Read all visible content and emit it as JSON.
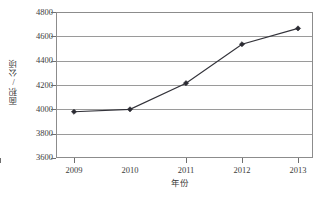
{
  "chart_data": {
    "type": "line",
    "title": "",
    "xlabel": "年份",
    "ylabel": "面积/公顷",
    "categories": [
      "2009",
      "2010",
      "2011",
      "2012",
      "2013"
    ],
    "x": [
      2009,
      2010,
      2011,
      2012,
      2013
    ],
    "series": [
      {
        "name": "面积",
        "values": [
          3980,
          4000,
          4215,
          4535,
          4665
        ]
      }
    ],
    "ylim": [
      3600,
      4800
    ],
    "yticks": [
      4800,
      4600,
      4400,
      4200,
      4000,
      3800,
      3600
    ],
    "ytick_labels": [
      "4800",
      "4600",
      "4400",
      "4200",
      "4000",
      "3800",
      "3600"
    ],
    "xtick_labels": [
      "2009",
      "2010",
      "2011",
      "2012",
      "2013"
    ],
    "grid": "horizontal",
    "legend": "none",
    "marker": "diamond",
    "colors": {
      "line": "#33333a",
      "marker": "#2b2b33",
      "grid": "#9a9a9a",
      "frame": "#8c8c8c",
      "text": "#3c3c3c",
      "background": "#ffffff"
    }
  },
  "axes": {
    "y_title": "面积/公顷",
    "x_title": "年份",
    "y_labels": {
      "t0": "4800",
      "t1": "4600",
      "t2": "4400",
      "t3": "4200",
      "t4": "4000",
      "t5": "3800",
      "t6": "3600"
    },
    "x_labels": {
      "t0": "2009",
      "t1": "2010",
      "t2": "2011",
      "t3": "2012",
      "t4": "2013"
    }
  }
}
